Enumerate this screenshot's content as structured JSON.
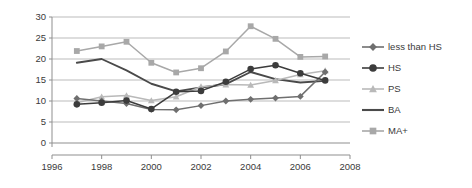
{
  "chart_data": {
    "type": "line",
    "title": "",
    "xlabel": "",
    "ylabel": "",
    "xlim": [
      1996,
      2008
    ],
    "ylim": [
      0,
      30
    ],
    "grid": true,
    "legend_position": "right",
    "x": [
      1997,
      1998,
      1999,
      2000,
      2001,
      2002,
      2003,
      2004,
      2005,
      2006,
      2007
    ],
    "xticks": [
      "1996",
      "1998",
      "2000",
      "2002",
      "2004",
      "2006",
      "2008"
    ],
    "xtick_values": [
      1996,
      1998,
      2000,
      2002,
      2004,
      2006,
      2008
    ],
    "yticks": [
      "0",
      "5",
      "10",
      "15",
      "20",
      "25",
      "30"
    ],
    "ytick_values": [
      0,
      5,
      10,
      15,
      20,
      25,
      30
    ],
    "series": [
      {
        "name": "less than HS",
        "marker": "diamond",
        "color": "#6f6f6f",
        "values": [
          10.6,
          10.0,
          9.4,
          8.0,
          7.9,
          8.9,
          10.0,
          10.4,
          10.7,
          11.1,
          16.9
        ]
      },
      {
        "name": "HS",
        "marker": "circle",
        "color": "#3c3c3c",
        "values": [
          9.2,
          9.6,
          10.1,
          8.1,
          12.2,
          12.4,
          14.6,
          17.6,
          18.5,
          16.6,
          14.9
        ]
      },
      {
        "name": "PS",
        "marker": "triangle",
        "color": "#b9b9b9",
        "values": [
          9.6,
          11.0,
          11.3,
          10.1,
          11.0,
          13.4,
          13.9,
          13.8,
          14.9,
          16.3,
          17.2
        ]
      },
      {
        "name": "BA",
        "marker": "none",
        "color": "#4a4a4a",
        "values": [
          19.1,
          20.0,
          17.3,
          14.1,
          12.3,
          13.2,
          14.0,
          16.9,
          15.2,
          14.4,
          14.8
        ]
      },
      {
        "name": "MA+",
        "marker": "square",
        "color": "#a8a8a8",
        "values": [
          21.9,
          23.0,
          24.1,
          19.1,
          16.8,
          17.8,
          21.8,
          27.8,
          24.8,
          20.5,
          20.6
        ]
      }
    ]
  },
  "legend": {
    "items": [
      {
        "label": "less than HS"
      },
      {
        "label": "HS"
      },
      {
        "label": "PS"
      },
      {
        "label": "BA"
      },
      {
        "label": "MA+"
      }
    ]
  }
}
